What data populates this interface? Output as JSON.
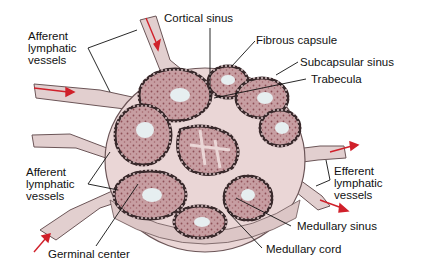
{
  "diagram": {
    "labels": {
      "afferent_top": "Afferent\nlymphatic\nvessels",
      "cortical_sinus": "Cortical sinus",
      "fibrous_capsule": "Fibrous capsule",
      "subcapsular_sinus": "Subcapsular sinus",
      "trabecula": "Trabecula",
      "afferent_bottom": "Afferent\nlymphatic\nvessels",
      "efferent": "Efferent\nlymphatic\nvessels",
      "medullary_sinus": "Medullary sinus",
      "medullary_cord": "Medullary cord",
      "germinal_center": "Germinal center"
    },
    "colors": {
      "capsule": "#ead6d6",
      "cortex": "#b98a8e",
      "follicle_dots": "#2a2a2a",
      "germinal_center": "#e6eef0",
      "vessel": "#e2cfcf",
      "flow_arrow": "#d0202a",
      "leader_line": "#111111"
    }
  }
}
